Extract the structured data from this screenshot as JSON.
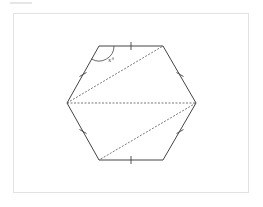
{
  "figure": {
    "type": "regular hexagon with diagonals",
    "angle_label": "x°",
    "colors": {
      "stroke": "#444444",
      "dashed": "#555555",
      "frame_border": "#e2e2e2",
      "background": "#ffffff"
    },
    "vertices": {
      "top_left": [
        99,
        46
      ],
      "top_right": [
        163,
        46
      ],
      "right": [
        196,
        103
      ],
      "bottom_right": [
        163,
        160
      ],
      "bottom_left": [
        99,
        160
      ],
      "left": [
        67,
        103
      ]
    },
    "dashed_diagonals": [
      [
        "left",
        "top_right"
      ],
      [
        "left",
        "right"
      ],
      [
        "right",
        "bottom_left"
      ]
    ],
    "tick_marks_on_sides": 6,
    "angle_marked_at": "top_left"
  }
}
